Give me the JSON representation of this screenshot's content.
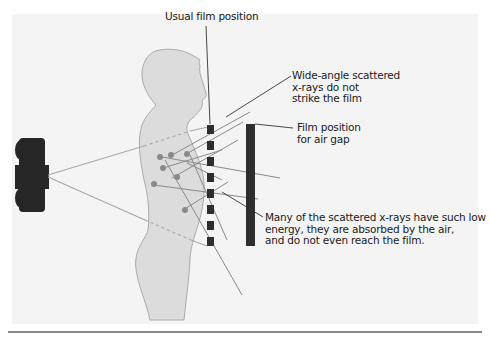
{
  "figure": {
    "colors": {
      "background": "#f4f4f4",
      "body_fill": "#dcdcdc",
      "body_outline": "#9a9a9a",
      "tube": "#262626",
      "film": "#2e2e2e",
      "primary_beam": "#a8a8a8",
      "scatter_ray": "#8a8a8a",
      "scatter_point": "#8a8a8a",
      "leader_line": "#333333"
    }
  },
  "labels": {
    "usual_film_position": "Usual film position",
    "wide_angle": {
      "line1": "Wide-angle scattered",
      "line2": "x-rays do not",
      "line3": "strike the film"
    },
    "air_gap": {
      "line1": "Film position",
      "line2": "for air gap"
    },
    "absorbed": {
      "line1": "Many of the scattered x-rays have such low",
      "line2": "energy, they are absorbed by the air,",
      "line3": "and do not even reach the film."
    }
  },
  "elements": {
    "xray_tube": "x-ray tube",
    "patient": "patient silhouette",
    "usual_film_segments": 8,
    "scatter_points": 8
  }
}
